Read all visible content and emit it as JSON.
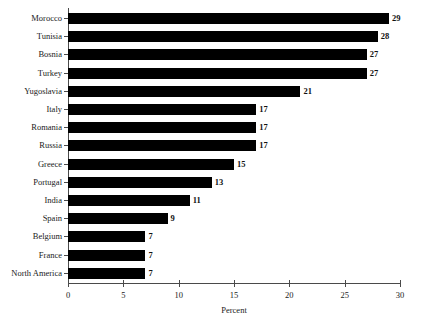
{
  "chart_data": {
    "type": "bar",
    "orientation": "horizontal",
    "title": "",
    "xlabel": "Percent",
    "ylabel": "",
    "xlim": [
      0,
      30
    ],
    "xticks": [
      0,
      5,
      10,
      15,
      20,
      25,
      30
    ],
    "xticklabels": [
      "0",
      "5",
      "10",
      "15",
      "20",
      "25",
      "30"
    ],
    "grid": false,
    "legend": null,
    "categories": [
      "Morocco",
      "Tunisia",
      "Bosnia",
      "Turkey",
      "Yugoslavia",
      "Italy",
      "Romania",
      "Russia",
      "Greece",
      "Portugal",
      "India",
      "Spain",
      "Belgium",
      "France",
      "North America"
    ],
    "values": [
      29,
      28,
      27,
      27,
      21,
      17,
      17,
      17,
      15,
      13,
      11,
      9,
      7,
      7,
      7
    ],
    "data_labels": [
      "29",
      "28",
      "27",
      "27",
      "21",
      "17",
      "17",
      "17",
      "15",
      "13",
      "11",
      "9",
      "7",
      "7",
      "7"
    ],
    "bar_color": "#000000",
    "axis_color": "#4a4a4a",
    "background_color": "#ffffff"
  }
}
